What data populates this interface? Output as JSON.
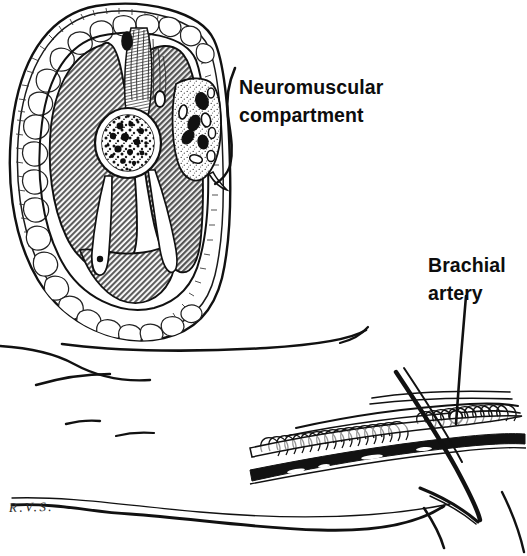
{
  "figure": {
    "background_color": "#ffffff",
    "ink_color": "#0d0d0d",
    "muscle_fill": "#808080",
    "fat_fill": "#ffffff",
    "vessel_fill": "#111111"
  },
  "labels": {
    "neuromuscular": {
      "line1": "Neuromuscular",
      "line2": "compartment",
      "pointer": "curly-bracket",
      "points_to": "neurovascular-bundle"
    },
    "brachial": {
      "line1": "Brachial",
      "line2": "artery",
      "pointer": "leader-line",
      "points_to": "brachial-artery-longitudinal"
    }
  },
  "signature": {
    "text": "R.V.S.",
    "type": "artist-signature"
  },
  "panels": {
    "cross_section": {
      "name": "upper-arm-cross-section",
      "structures": [
        "skin",
        "subcutaneous-fat",
        "deep-fascia",
        "biceps-brachii",
        "brachialis",
        "triceps-brachii",
        "humerus",
        "bone-marrow",
        "intermuscular-septum",
        "neurovascular-bundle",
        "brachial-artery",
        "brachial-veins",
        "median-nerve",
        "cephalic-vein",
        "basilic-vein"
      ]
    },
    "longitudinal": {
      "name": "brachial-artery-longitudinal-view",
      "structures": [
        "brachial-artery",
        "venae-comitantes",
        "nerve-fascicles",
        "fascial-sheath",
        "surgical-instrument-tip"
      ]
    },
    "contours": {
      "name": "arm-surface-contours",
      "count": 5
    }
  },
  "icons": {
    "bracket": "curly-bracket-icon",
    "leader": "leader-line-icon"
  }
}
